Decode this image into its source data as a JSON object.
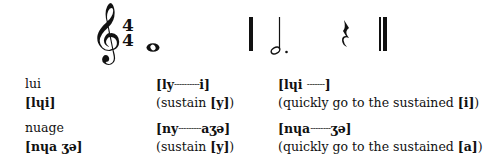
{
  "notation": {
    "clef": "treble-clef",
    "clef_glyph": "𝄞",
    "time_signature": {
      "top": "4",
      "bottom": "4"
    },
    "measure1": {
      "note": "whole-note"
    },
    "measure2": {
      "note": "dotted-half-note",
      "rest": "quarter-rest"
    },
    "ending": "double-barline"
  },
  "rows": [
    {
      "word": "lui",
      "ipa": "[lɥi]",
      "wrong": {
        "pre": "[ly",
        "dashes": "----------",
        "post": "i]",
        "note_pre": "(sustain ",
        "note_bold": "[y]",
        "note_post": ")"
      },
      "right": {
        "pre": "[lɥi ",
        "dashes": "-------",
        "post": "]",
        "note_pre": "(quickly go to the sustained ",
        "note_bold": "[i]",
        "note_post": ")"
      }
    },
    {
      "word": "nuage",
      "ipa": "[nɥa ʒə]",
      "wrong": {
        "pre": "[ny",
        "dashes": "---------",
        "post": "aʒə]",
        "note_pre": "(sustain ",
        "note_bold": "[y]",
        "note_post": ")"
      },
      "right": {
        "pre": "[nɥa",
        "dashes": "--------",
        "post": "ʒə]",
        "note_pre": "(quickly go to the sustained ",
        "note_bold": "[a]",
        "note_post": ")"
      }
    }
  ]
}
